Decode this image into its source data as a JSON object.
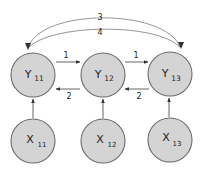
{
  "diagram": {
    "nodes": [
      {
        "id": "Y11",
        "letter": "Y",
        "sub": "11",
        "cx": 33,
        "cy": 75
      },
      {
        "id": "Y12",
        "letter": "Y",
        "sub": "12",
        "cx": 103,
        "cy": 75
      },
      {
        "id": "Y13",
        "letter": "Y",
        "sub": "13",
        "cx": 170,
        "cy": 74
      },
      {
        "id": "X11",
        "letter": "X",
        "sub": "11",
        "cx": 33,
        "cy": 141
      },
      {
        "id": "X12",
        "letter": "X",
        "sub": "12",
        "cx": 103,
        "cy": 141
      },
      {
        "id": "X13",
        "letter": "X",
        "sub": "13",
        "cx": 170,
        "cy": 140
      }
    ],
    "edges": [
      {
        "from": "Y11",
        "to": "Y12",
        "label": "1"
      },
      {
        "from": "Y12",
        "to": "Y13",
        "label": "1"
      },
      {
        "from": "Y12",
        "to": "Y11",
        "label": "2"
      },
      {
        "from": "Y13",
        "to": "Y12",
        "label": "2"
      },
      {
        "from": "Y11",
        "to": "Y13",
        "label": "3",
        "type": "arc"
      },
      {
        "from": "Y13",
        "to": "Y11",
        "label": "4",
        "type": "arc"
      },
      {
        "from": "X11",
        "to": "Y11",
        "label": ""
      },
      {
        "from": "X12",
        "to": "Y12",
        "label": ""
      },
      {
        "from": "X13",
        "to": "Y13",
        "label": ""
      }
    ],
    "labels": {
      "fwd1": "1",
      "fwd2": "1",
      "back1": "2",
      "back2": "2",
      "arc_top": "3",
      "arc_bottom": "4"
    },
    "colors": {
      "node_fill": "#d4d4d4",
      "node_stroke": "#6a6a6a",
      "edge": "#555555",
      "arc": "#888888"
    }
  }
}
